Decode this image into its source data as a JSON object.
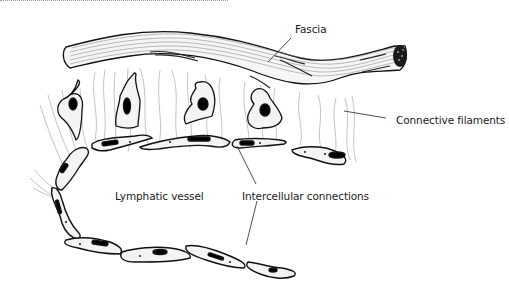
{
  "figure": {
    "type": "anatomical-illustration",
    "labels": {
      "fascia": "Fascia",
      "connective_filaments": "Connective filaments",
      "lymphatic_vessel": "Lymphatic vessel",
      "intercellular_connections": "Intercellular connections"
    },
    "colors": {
      "ink": "#111111",
      "filament": "#b8b8b8",
      "cell_fill": "#f4f4f4",
      "nucleus": "#0a0a0a",
      "background": "#ffffff"
    }
  }
}
